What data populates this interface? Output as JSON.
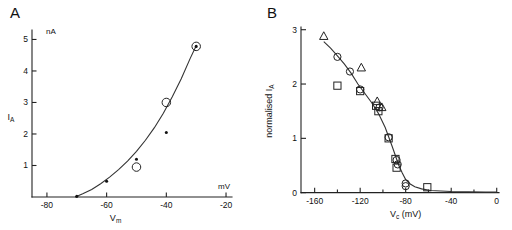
{
  "figure": {
    "panels": [
      {
        "letter": "A",
        "x_axis": {
          "title": "V",
          "title_sub": "m",
          "unit_label": "mV",
          "ticks": [
            "-80",
            "-60",
            "-40",
            "-20"
          ],
          "tick_values": [
            -80,
            -60,
            -40,
            -20
          ],
          "range": [
            -85,
            -18
          ]
        },
        "y_axis": {
          "title": "I",
          "title_sub": "A",
          "unit_label": "nA",
          "ticks": [
            "1",
            "2",
            "3",
            "4",
            "5"
          ],
          "tick_values": [
            1,
            2,
            3,
            4,
            5
          ],
          "range": [
            0,
            5.3
          ]
        }
      },
      {
        "letter": "B",
        "x_axis": {
          "title": "V",
          "title_sub": "c",
          "title_unit": "(mV)",
          "ticks": [
            "-160",
            "-120",
            "-80",
            "-40",
            "0"
          ],
          "tick_values": [
            -160,
            -120,
            -80,
            -40,
            0
          ],
          "minor_tick_values": [
            -140,
            -100,
            -60,
            -20
          ],
          "range": [
            -172,
            2
          ]
        },
        "y_axis": {
          "title": "normalised I",
          "title_sub": "A",
          "ticks": [
            "0",
            "1",
            "2",
            "3"
          ],
          "tick_values": [
            0,
            1,
            2,
            3
          ],
          "range": [
            -0.08,
            3.05
          ]
        }
      }
    ]
  },
  "chart_data": [
    {
      "type": "scatter",
      "title": "A",
      "xlabel": "Vm",
      "ylabel": "IA",
      "xunit": "mV",
      "yunit": "nA",
      "xlim": [
        -85,
        -18
      ],
      "ylim": [
        0,
        5.3
      ],
      "grid": false,
      "legend": "none",
      "series": [
        {
          "name": "filled-circle",
          "marker": "filled-circle",
          "points": [
            {
              "x": -70,
              "y": 0.02
            },
            {
              "x": -60,
              "y": 0.5
            },
            {
              "x": -50,
              "y": 1.2
            },
            {
              "x": -40,
              "y": 2.05
            },
            {
              "x": -30,
              "y": 4.78
            }
          ]
        },
        {
          "name": "open-circle",
          "marker": "open-circle",
          "points": [
            {
              "x": -50,
              "y": 0.95
            },
            {
              "x": -40,
              "y": 3.0
            },
            {
              "x": -30,
              "y": 4.78
            }
          ]
        }
      ],
      "fit_curve": {
        "name": "exponential-fit",
        "points": [
          {
            "x": -70.5,
            "y": 0.0
          },
          {
            "x": -68,
            "y": 0.1
          },
          {
            "x": -65,
            "y": 0.24
          },
          {
            "x": -62,
            "y": 0.42
          },
          {
            "x": -59,
            "y": 0.63
          },
          {
            "x": -56,
            "y": 0.87
          },
          {
            "x": -53,
            "y": 1.14
          },
          {
            "x": -50,
            "y": 1.45
          },
          {
            "x": -47,
            "y": 1.8
          },
          {
            "x": -44,
            "y": 2.2
          },
          {
            "x": -41,
            "y": 2.66
          },
          {
            "x": -38,
            "y": 3.18
          },
          {
            "x": -35,
            "y": 3.75
          },
          {
            "x": -32,
            "y": 4.4
          },
          {
            "x": -30,
            "y": 4.8
          }
        ]
      }
    },
    {
      "type": "scatter",
      "title": "B",
      "xlabel": "Vc (mV)",
      "ylabel": "normalised IA",
      "xlim": [
        -172,
        2
      ],
      "ylim": [
        -0.08,
        3.05
      ],
      "grid": false,
      "legend": "none",
      "series": [
        {
          "name": "triangle",
          "marker": "open-triangle",
          "points": [
            {
              "x": -152,
              "y": 2.88
            },
            {
              "x": -119,
              "y": 2.3
            },
            {
              "x": -105,
              "y": 1.68
            },
            {
              "x": -101,
              "y": 1.57
            }
          ]
        },
        {
          "name": "circle",
          "marker": "open-circle",
          "points": [
            {
              "x": -140,
              "y": 2.5
            },
            {
              "x": -129,
              "y": 2.23
            },
            {
              "x": -120,
              "y": 1.9
            },
            {
              "x": -103,
              "y": 1.57
            },
            {
              "x": -95,
              "y": 1.02
            },
            {
              "x": -88,
              "y": 0.6
            },
            {
              "x": -87,
              "y": 0.52
            },
            {
              "x": -80,
              "y": 0.17
            },
            {
              "x": -80,
              "y": 0.12
            }
          ]
        },
        {
          "name": "square",
          "marker": "open-square",
          "points": [
            {
              "x": -140,
              "y": 1.97
            },
            {
              "x": -120,
              "y": 1.87
            },
            {
              "x": -106,
              "y": 1.6
            },
            {
              "x": -104,
              "y": 1.5
            },
            {
              "x": -95,
              "y": 1.0
            },
            {
              "x": -89,
              "y": 0.62
            },
            {
              "x": -88,
              "y": 0.46
            },
            {
              "x": -61,
              "y": 0.1
            }
          ]
        }
      ],
      "fit_curve": {
        "name": "sigmoid-fit",
        "points": [
          {
            "x": -152,
            "y": 2.78
          },
          {
            "x": -146,
            "y": 2.66
          },
          {
            "x": -140,
            "y": 2.52
          },
          {
            "x": -134,
            "y": 2.37
          },
          {
            "x": -128,
            "y": 2.2
          },
          {
            "x": -122,
            "y": 2.0
          },
          {
            "x": -116,
            "y": 1.83
          },
          {
            "x": -110,
            "y": 1.66
          },
          {
            "x": -104,
            "y": 1.46
          },
          {
            "x": -98,
            "y": 1.2
          },
          {
            "x": -95,
            "y": 1.03
          },
          {
            "x": -92,
            "y": 0.86
          },
          {
            "x": -89,
            "y": 0.68
          },
          {
            "x": -86,
            "y": 0.5
          },
          {
            "x": -83,
            "y": 0.36
          },
          {
            "x": -80,
            "y": 0.24
          },
          {
            "x": -76,
            "y": 0.16
          },
          {
            "x": -72,
            "y": 0.11
          },
          {
            "x": -66,
            "y": 0.07
          },
          {
            "x": -58,
            "y": 0.04
          },
          {
            "x": -40,
            "y": 0.02
          },
          {
            "x": -10,
            "y": 0.01
          },
          {
            "x": 0,
            "y": 0.01
          }
        ]
      }
    }
  ]
}
